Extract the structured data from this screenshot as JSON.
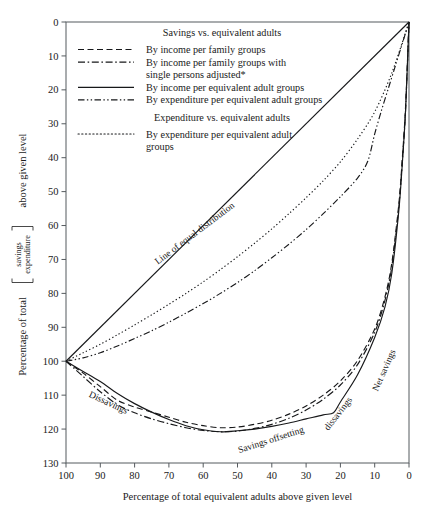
{
  "chart_data": {
    "type": "line",
    "title": "",
    "xlabel": "Percentage of total equivalent adults above given level",
    "ylabel_prefix": "Percentage of total",
    "ylabel_numerator": "savings",
    "ylabel_denominator": "expenditure",
    "ylabel_suffix": "above given level",
    "xlim": [
      100,
      0
    ],
    "ylim": [
      0,
      130
    ],
    "x_ticks": [
      100,
      90,
      80,
      70,
      60,
      50,
      40,
      30,
      20,
      10,
      0
    ],
    "y_ticks": [
      0,
      10,
      20,
      30,
      40,
      50,
      60,
      70,
      80,
      90,
      100,
      110,
      120,
      130
    ],
    "x_axis_reversed": true,
    "y_axis_inverted": true,
    "grid": false,
    "legend_position": "upper-left-inside",
    "series": [
      {
        "name": "Line of equal distribution",
        "style": "solid",
        "is_reference": true,
        "x": [
          100,
          0
        ],
        "y": [
          100,
          0
        ]
      },
      {
        "name": "By income per family groups",
        "group": "Savings vs. equivalent adults",
        "style": "dashed",
        "x": [
          100,
          95,
          90,
          85,
          80,
          75,
          70,
          65,
          60,
          55,
          50,
          45,
          40,
          35,
          30,
          25,
          20,
          15,
          10,
          7,
          5,
          3,
          2,
          1,
          0
        ],
        "y": [
          100,
          103.5,
          107.5,
          111.5,
          113.5,
          115.0,
          116.5,
          118.0,
          119.0,
          119.6,
          119.4,
          118.6,
          117.4,
          115.6,
          113.2,
          110.0,
          105.8,
          99.8,
          90.5,
          81.0,
          71.0,
          54.0,
          41.0,
          25.0,
          0
        ]
      },
      {
        "name": "By income per family groups with single persons adjusted*",
        "group": "Savings vs. equivalent adults",
        "style": "dash-dot",
        "x": [
          100,
          95,
          90,
          85,
          80,
          75,
          70,
          65,
          60,
          55,
          50,
          45,
          40,
          35,
          30,
          25,
          20,
          15,
          10,
          7,
          5,
          3,
          2,
          1,
          0
        ],
        "y": [
          100,
          104.5,
          109.0,
          112.8,
          115.2,
          117.0,
          118.4,
          119.6,
          120.4,
          120.8,
          120.6,
          119.8,
          118.6,
          116.8,
          114.4,
          111.2,
          107.0,
          101.0,
          91.5,
          82.0,
          72.0,
          55.0,
          42.0,
          26.0,
          0
        ]
      },
      {
        "name": "By income per equivalent adult groups",
        "group": "Savings vs. equivalent adults",
        "style": "solid",
        "x": [
          100,
          95,
          90,
          85,
          80,
          75,
          70,
          65,
          60,
          55,
          50,
          45,
          40,
          35,
          30,
          25,
          22,
          20,
          15,
          10,
          7,
          5,
          3,
          2,
          1,
          0
        ],
        "y": [
          100,
          103.0,
          106.0,
          109.5,
          112.5,
          115.0,
          117.2,
          119.0,
          120.2,
          120.8,
          120.5,
          120.0,
          119.2,
          118.2,
          117.0,
          115.8,
          115.2,
          112.0,
          104.0,
          93.0,
          84.0,
          74.0,
          56.0,
          42.5,
          26.0,
          0
        ]
      },
      {
        "name": "By expenditure per equivalent adult groups",
        "group": "Savings vs. equivalent adults",
        "style": "dash-dot-dot",
        "x": [
          100,
          95,
          90,
          85,
          80,
          75,
          70,
          65,
          60,
          55,
          50,
          45,
          40,
          35,
          30,
          25,
          20,
          15,
          12,
          10,
          8,
          6,
          4,
          2,
          0
        ],
        "y": [
          100,
          99.0,
          97.5,
          95.5,
          93.3,
          91.0,
          88.5,
          85.8,
          83.0,
          80.0,
          76.8,
          73.3,
          69.5,
          65.5,
          61.2,
          56.5,
          51.5,
          46.0,
          41.0,
          33.0,
          26.0,
          19.5,
          13.0,
          6.5,
          0
        ]
      },
      {
        "name": "By expenditure per equivalent adult groups",
        "group": "Expenditure vs. equivalent adults",
        "style": "dotted",
        "x": [
          100,
          95,
          90,
          85,
          80,
          75,
          70,
          65,
          60,
          55,
          50,
          45,
          40,
          35,
          30,
          25,
          20,
          15,
          10,
          5,
          0
        ],
        "y": [
          100,
          97.5,
          95.0,
          92.2,
          89.3,
          86.3,
          83.2,
          80.0,
          76.6,
          73.0,
          69.2,
          65.2,
          61.0,
          56.5,
          51.8,
          46.8,
          41.2,
          34.5,
          26.5,
          15.0,
          0
        ]
      }
    ],
    "annotations": [
      {
        "name": "line-of-equal-distribution",
        "text": "Line of equal distribution",
        "x": 62,
        "y": 63,
        "rotate": -37
      },
      {
        "name": "dissavings",
        "text": "Dissavings",
        "x": 88,
        "y": 113,
        "rotate": 25
      },
      {
        "name": "savings-offsetting-dissavings-part1",
        "text": "Savings offsetting",
        "x": 40,
        "y": 124,
        "rotate": -18
      },
      {
        "name": "savings-offsetting-dissavings-part2",
        "text": "dissavings",
        "x": 20,
        "y": 116,
        "rotate": -52
      },
      {
        "name": "net-savings",
        "text": "Net savings",
        "x": 6.5,
        "y": 103,
        "rotate": -66
      }
    ]
  },
  "legend": {
    "groups": [
      {
        "heading": "Savings vs. equivalent adults",
        "entries": [
          {
            "style": "dashed",
            "label": "By income per family groups"
          },
          {
            "style": "dash-dot",
            "label": "By income per family groups with",
            "label2": "single persons adjusted*"
          },
          {
            "style": "solid",
            "label": "By income per equivalent adult groups"
          },
          {
            "style": "dash-dot-dot",
            "label": "By expenditure per equivalent adult groups"
          }
        ]
      },
      {
        "heading": "Expenditure vs. equivalent adults",
        "entries": [
          {
            "style": "dotted",
            "label": "By expenditure per equivalent adult",
            "label2": "groups"
          }
        ]
      }
    ]
  }
}
